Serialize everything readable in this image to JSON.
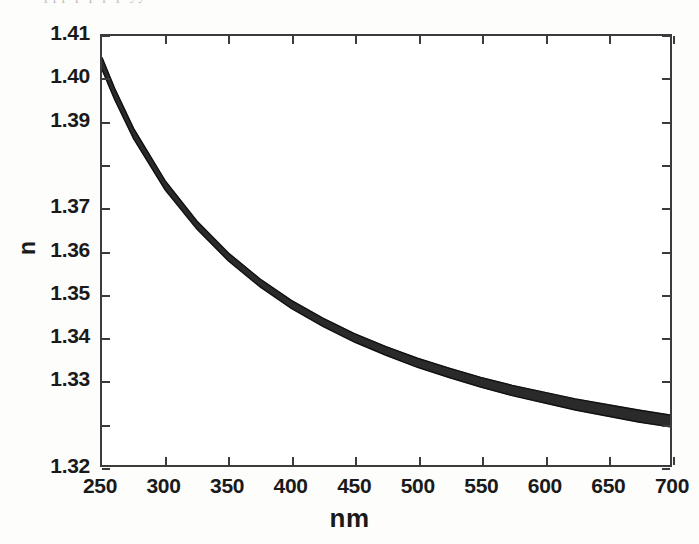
{
  "figure": {
    "scan_artifact_text": "ppp  p     p    p p         yy"
  },
  "axes": {
    "ylabel": "n",
    "xlabel": "nm",
    "ytick_labels": [
      "1.41",
      "1.40",
      "1.39",
      "1.37",
      "1.36",
      "1.35",
      "1.34",
      "1.33",
      "1.32"
    ],
    "xtick_labels": [
      "250",
      "300",
      "350",
      "400",
      "450",
      "500",
      "550",
      "600",
      "650",
      "700"
    ]
  },
  "chart_data": {
    "type": "line",
    "title": "",
    "xlabel": "nm",
    "ylabel": "n",
    "xlim": [
      250,
      700
    ],
    "ylim": [
      1.32,
      1.41
    ],
    "xticks": [
      250,
      300,
      350,
      400,
      450,
      500,
      550,
      600,
      650,
      700
    ],
    "yticks": [
      1.32,
      1.33,
      1.34,
      1.35,
      1.36,
      1.37,
      1.38,
      1.39,
      1.4,
      1.41
    ],
    "ytick_labels_as_printed": [
      "1.32",
      "1.33",
      "1.34",
      "1.35",
      "1.36",
      "1.37",
      "1.39",
      "1.40",
      "1.41"
    ],
    "grid": false,
    "legend": null,
    "x": [
      250,
      260,
      275,
      300,
      325,
      350,
      375,
      400,
      425,
      450,
      475,
      500,
      525,
      550,
      575,
      600,
      625,
      650,
      675,
      700
    ],
    "series": [
      {
        "name": "upper envelope",
        "values": [
          1.4055,
          1.4005,
          1.394,
          1.3855,
          1.379,
          1.3738,
          1.3696,
          1.3661,
          1.3632,
          1.3607,
          1.3586,
          1.3567,
          1.3551,
          1.3536,
          1.3523,
          1.3512,
          1.3501,
          1.3492,
          1.3483,
          1.3475
        ]
      },
      {
        "name": "lower envelope",
        "values": [
          1.403,
          1.398,
          1.3915,
          1.383,
          1.3765,
          1.3712,
          1.3669,
          1.3633,
          1.3603,
          1.3577,
          1.3555,
          1.3535,
          1.3518,
          1.3502,
          1.3488,
          1.3476,
          1.3464,
          1.3454,
          1.3444,
          1.3436
        ]
      }
    ],
    "band_note": "Band width grows from about 0.0025 at 250 nm to about 0.004 at 700 nm.",
    "band_start": {
      "x": 250,
      "y_top": 1.4055,
      "y_bottom": 1.403
    },
    "band_end": {
      "x": 700,
      "y_top": 1.3305,
      "y_bottom": 1.328
    }
  }
}
